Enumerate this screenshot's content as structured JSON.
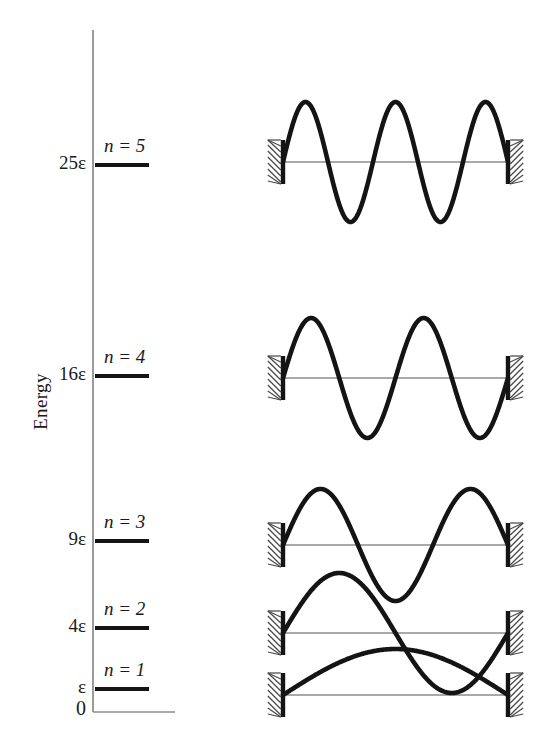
{
  "figure": {
    "axis_title": "Energy",
    "baseline_label": "0",
    "type": "particle-in-a-box energy level diagram with wavefunctions"
  },
  "chart_data": {
    "type": "diagram",
    "title": "",
    "xlabel": "",
    "ylabel": "Energy",
    "grid": false,
    "legend": null,
    "energy_unit": "ε",
    "levels": [
      {
        "n": 1,
        "energy_label": "ε",
        "n_label": "n = 1",
        "energy_value": 1,
        "y_px": 689,
        "half_waves": 1
      },
      {
        "n": 2,
        "energy_label": "4ε",
        "n_label": "n = 2",
        "energy_value": 4,
        "y_px": 628,
        "half_waves": 2
      },
      {
        "n": 3,
        "energy_label": "9ε",
        "n_label": "n = 3",
        "energy_value": 9,
        "y_px": 541,
        "half_waves": 3
      },
      {
        "n": 4,
        "energy_label": "16ε",
        "n_label": "n = 4",
        "energy_value": 16,
        "y_px": 376,
        "half_waves": 4
      },
      {
        "n": 5,
        "energy_label": "25ε",
        "n_label": "n = 5",
        "energy_value": 25,
        "y_px": 165,
        "half_waves": 5
      }
    ],
    "wavefunctions": [
      {
        "n": 1,
        "half_waves": 1,
        "baseline_y": 695,
        "amplitude": 46
      },
      {
        "n": 2,
        "half_waves": 2,
        "baseline_y": 633,
        "amplitude": 60
      },
      {
        "n": 3,
        "half_waves": 3,
        "baseline_y": 545,
        "amplitude": 56
      },
      {
        "n": 4,
        "half_waves": 4,
        "baseline_y": 378,
        "amplitude": 60
      },
      {
        "n": 5,
        "half_waves": 5,
        "baseline_y": 162,
        "amplitude": 60
      }
    ],
    "box_left_px": 283,
    "box_right_px": 508
  },
  "colors": {
    "ink": "#141414",
    "axis": "#9a9a9a",
    "baseline": "#8c8c8c",
    "hatch": "#4a4a4a",
    "background": "#ffffff"
  }
}
